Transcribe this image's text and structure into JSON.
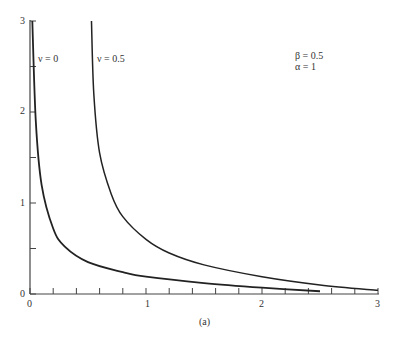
{
  "chart_data": {
    "type": "line",
    "title": "",
    "caption": "(a)",
    "xlabel": "",
    "ylabel": "",
    "xlim": [
      0,
      3
    ],
    "ylim": [
      0,
      3
    ],
    "x_ticks": [
      "0",
      "1",
      "2",
      "3"
    ],
    "y_ticks": [
      "0",
      "1",
      "2",
      "3"
    ],
    "x_minor_tick_step": 0.2,
    "y_minor_tick_step": 0.5,
    "grid": false,
    "annotations": [
      "β = 0.5",
      "α = 1"
    ],
    "series": [
      {
        "name": "ν = 0",
        "x": [
          0.02,
          0.05,
          0.1,
          0.2,
          0.3,
          0.5,
          0.8,
          1.0,
          1.5,
          2.0,
          2.5
        ],
        "y": [
          3.0,
          1.9,
          1.2,
          0.72,
          0.52,
          0.35,
          0.24,
          0.19,
          0.12,
          0.07,
          0.03
        ]
      },
      {
        "name": "ν = 0.5",
        "x": [
          0.53,
          0.55,
          0.6,
          0.7,
          0.8,
          1.0,
          1.2,
          1.5,
          2.0,
          2.5,
          3.0
        ],
        "y": [
          3.0,
          2.2,
          1.55,
          1.1,
          0.85,
          0.6,
          0.45,
          0.32,
          0.19,
          0.1,
          0.04
        ]
      }
    ]
  },
  "labels": {
    "series0": "ν = 0",
    "series1": "ν = 0.5",
    "beta": "β = 0.5",
    "alpha": "α = 1",
    "caption": "(a)",
    "x0": "0",
    "x1": "1",
    "x2": "2",
    "x3": "3",
    "y0": "0",
    "y1": "1",
    "y2": "2",
    "y3": "3"
  }
}
